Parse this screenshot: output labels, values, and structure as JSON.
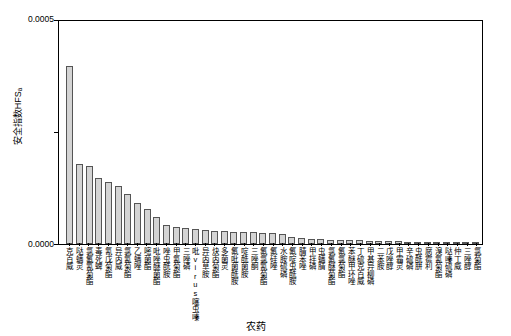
{
  "chart_data": {
    "type": "bar",
    "title": "",
    "xlabel": "农药",
    "ylabel": "安全指数HFSₐ",
    "ylim": [
      0,
      0.0005
    ],
    "ytick_labels": [
      "0.0005",
      "0.0000"
    ],
    "grid": false,
    "legend": null,
    "categories": [
      "克百威",
      "哒螨灵",
      "氯氟氰菊酯",
      "毒死蜱",
      "氰戊菊酯",
      "异丙威",
      "氯氰菊酯",
      "乙螨唑",
      "嘧菌酯",
      "吡唑醚菌酯",
      "唑虫酰胺",
      "甲氰菊酯",
      "三唑磷",
      "吡virus噻虫嗪",
      "异丙草胺",
      "炔丙菊酯",
      "多菌灵",
      "氟吡菌酰胺",
      "啶酰菌胺",
      "三唑酮",
      "氟氯氰菊酯",
      "氟硅唑",
      "水胺硫磷",
      "氟啶虫酰胺",
      "腈苯唑",
      "甲拌磷",
      "虫螨腈",
      "氯氟醚菊酯",
      "氟氯菊酯",
      "苯醚甲环唑",
      "丁硫克百威",
      "甲基异柳磷",
      "二苯胺",
      "戊唑醇",
      "甲霜灵",
      "辛硫磷",
      "虫酰肼",
      "腐霉利",
      "溴氰菊酯",
      "哒嗪硫磷",
      "仲丁威",
      "三唑醇",
      "氯菊酯"
    ],
    "values": [
      0.0004,
      0.00018,
      0.000175,
      0.000148,
      0.00014,
      0.00013,
      0.000112,
      9.2e-05,
      7.8e-05,
      6e-05,
      4.2e-05,
      3.8e-05,
      3.6e-05,
      3.4e-05,
      3.2e-05,
      3e-05,
      2.9e-05,
      2.8e-05,
      2.7e-05,
      2.6e-05,
      2.5e-05,
      2.4e-05,
      2.2e-05,
      1.6e-05,
      1.4e-05,
      1.2e-05,
      1.1e-05,
      1e-05,
      9e-06,
      8e-06,
      8e-06,
      7e-06,
      7e-06,
      6e-06,
      6e-06,
      5e-06,
      5e-06,
      4e-06,
      4e-06,
      3e-06,
      3e-06,
      2e-06,
      2e-06
    ]
  },
  "labels": {
    "y_axis_title": "安全指数HFSₐ",
    "x_axis_title": "农药",
    "y_top": "0.0005",
    "y_bottom": "0.0000"
  }
}
